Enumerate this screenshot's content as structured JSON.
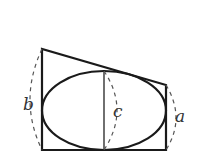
{
  "diagram": {
    "labels": {
      "b": "b",
      "c": "c",
      "a": "a"
    },
    "colors": {
      "stroke": "#1a1a1a",
      "dashed": "#555555",
      "label": "#333333",
      "background": "#ffffff"
    },
    "shapes": {
      "trapezoid": {
        "bottom_left": [
          42,
          150
        ],
        "top_left": [
          42,
          49
        ],
        "top_right": [
          166,
          85
        ],
        "bottom_right": [
          166,
          150
        ]
      },
      "ellipse": {
        "cx": 104,
        "cy": 110.5,
        "rx": 62,
        "ry": 39.5
      },
      "axis_line": {
        "x": 104,
        "y1": 71,
        "y2": 150
      }
    }
  }
}
